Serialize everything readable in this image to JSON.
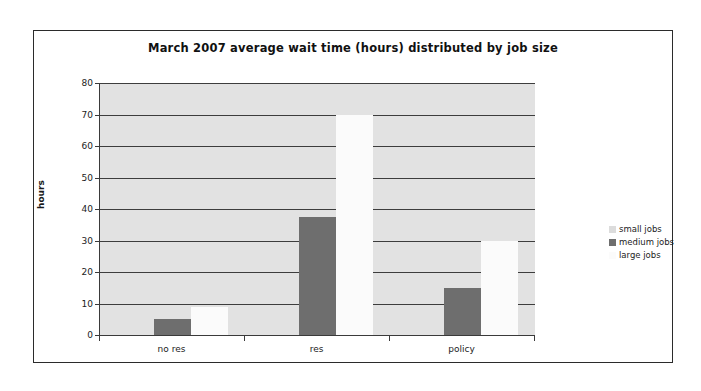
{
  "chart_data": {
    "type": "bar",
    "title": "March 2007 average wait time (hours) distributed by job size",
    "xlabel": "",
    "ylabel": "hours",
    "categories": [
      "no res",
      "res",
      "policy"
    ],
    "series": [
      {
        "name": "small jobs",
        "color": "#dcdcdc",
        "values": [
          0,
          0,
          0
        ]
      },
      {
        "name": "medium jobs",
        "color": "#6e6e6e",
        "values": [
          5,
          37.5,
          15
        ]
      },
      {
        "name": "large jobs",
        "color": "#fbfbfb",
        "values": [
          9,
          70,
          30
        ]
      }
    ],
    "ylim": [
      0,
      80
    ],
    "yticks": [
      "0",
      "10",
      "20",
      "30",
      "40",
      "50",
      "60",
      "70",
      "80"
    ],
    "grid": true,
    "legend_position": "right",
    "plot_background": "#e2e2e2",
    "frame_border": "#2b2b2b"
  },
  "legend": {
    "items": [
      {
        "label": "small jobs"
      },
      {
        "label": "medium jobs"
      },
      {
        "label": "large jobs"
      }
    ]
  }
}
